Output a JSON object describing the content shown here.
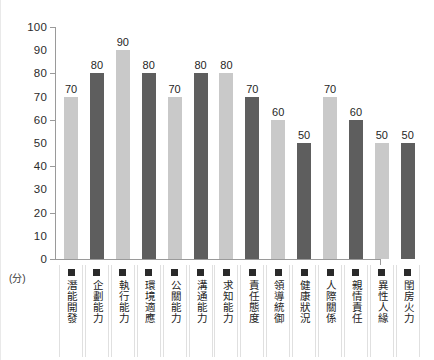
{
  "chart_data": {
    "type": "bar",
    "title": "",
    "subtitle": "",
    "xlabel": "",
    "ylabel": "",
    "unit_note": "(分)",
    "ylim": [
      0,
      100
    ],
    "yticks": [
      0,
      10,
      20,
      30,
      40,
      50,
      60,
      70,
      80,
      90,
      100
    ],
    "ytick_labels": [
      "0",
      "10",
      "20",
      "30",
      "40",
      "50",
      "60",
      "70",
      "80",
      "90",
      "100"
    ],
    "major_tick_step": 20,
    "grid": false,
    "legend": "none",
    "categories": [
      "潛能開發",
      "企劃能力",
      "執行能力",
      "環境適應",
      "公關能力",
      "溝通能力",
      "求知能力",
      "責任態度",
      "領導統御",
      "健康狀況",
      "人際關係",
      "親情責任",
      "異性人緣",
      "閨房火力"
    ],
    "values": [
      70,
      80,
      90,
      80,
      70,
      80,
      80,
      70,
      60,
      50,
      70,
      60,
      50,
      50
    ],
    "bar_shades": [
      "light",
      "dark",
      "light",
      "dark",
      "light",
      "dark",
      "light",
      "dark",
      "light",
      "dark",
      "light",
      "dark",
      "light",
      "dark"
    ],
    "colors": {
      "bar_light": "#c9c9c9",
      "bar_dark": "#5e5e5e",
      "axis": "#9a9a9a",
      "text": "#232323",
      "marker": "#2a2a2a",
      "background": "#ffffff",
      "separator": "#e0e0e0"
    },
    "marker_icon": "legend-square-marker"
  }
}
